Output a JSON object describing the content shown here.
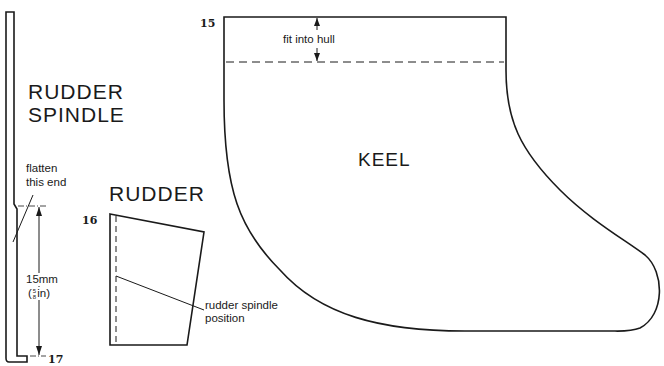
{
  "parts": {
    "rudder_spindle": {
      "title_line1": "RUDDER",
      "title_line2": "SPINDLE",
      "note_line1": "flatten",
      "note_line2": "this end",
      "dimension_mm": "15mm",
      "dimension_in_open": "(",
      "dimension_in_num": "5",
      "dimension_in_den": "8",
      "dimension_in_close": "in)",
      "part_number": "17"
    },
    "rudder": {
      "title": "RUDDER",
      "note_line1": "rudder spindle",
      "note_line2": "position",
      "part_number": "16"
    },
    "keel": {
      "title": "KEEL",
      "note": "fit into hull",
      "part_number": "15"
    }
  },
  "colors": {
    "line": "#1a1a1a",
    "background": "#ffffff"
  }
}
